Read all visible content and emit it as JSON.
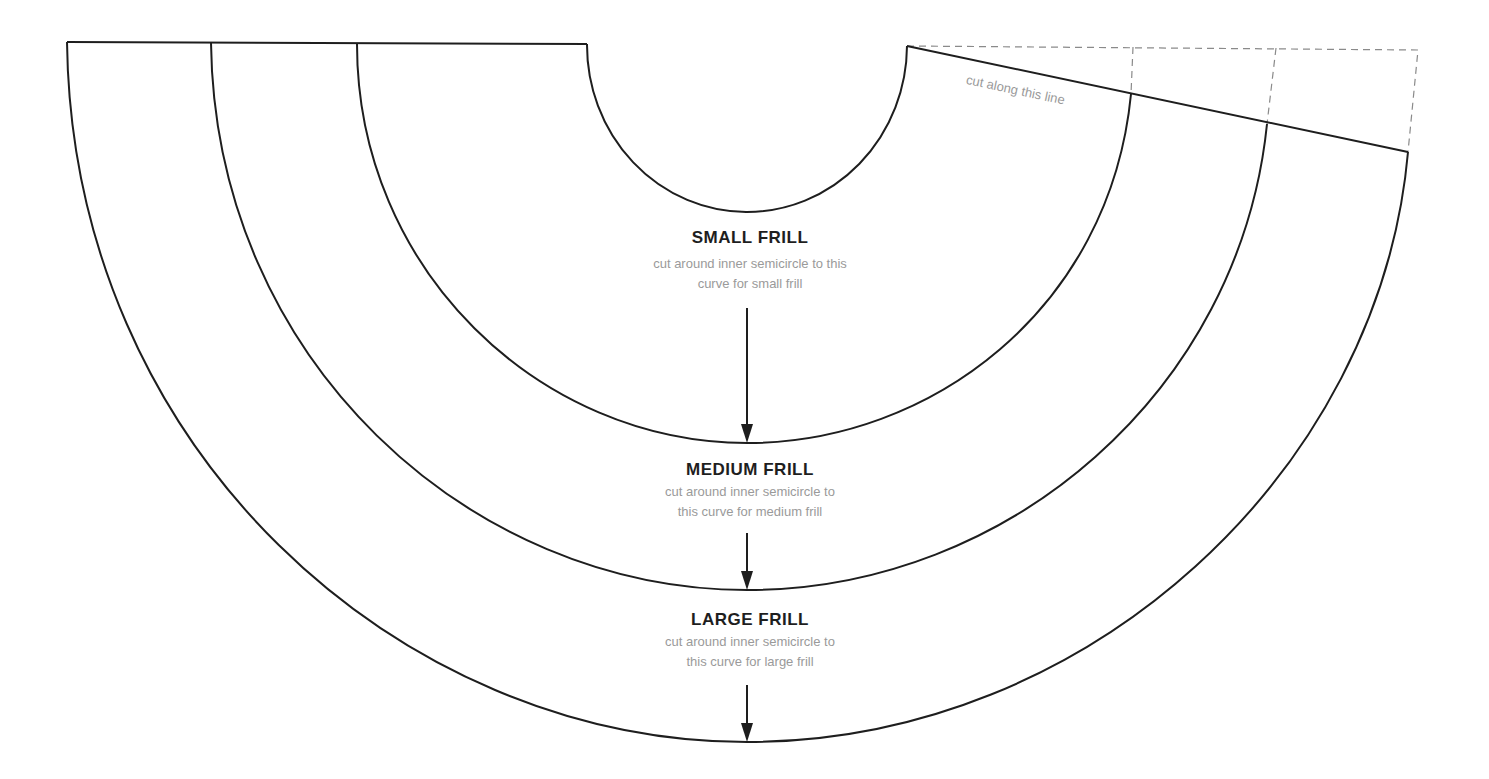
{
  "diagram": {
    "cut_note": "cut along this line",
    "frills": [
      {
        "title": "SMALL FRILL",
        "line1": "cut around inner semicircle to this",
        "line2": "curve for small frill"
      },
      {
        "title": "MEDIUM FRILL",
        "line1": "cut around inner semicircle to",
        "line2": "this curve for medium frill"
      },
      {
        "title": "LARGE FRILL",
        "line1": "cut around inner semicircle to",
        "line2": "this curve for large frill"
      }
    ],
    "colors": {
      "line": "#1e1e1e",
      "dashed": "#8a8a8a",
      "text_muted": "#9a9a9a"
    }
  }
}
